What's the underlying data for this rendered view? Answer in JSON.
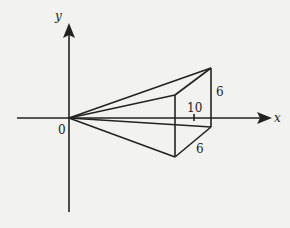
{
  "diagram": {
    "axes": {
      "x_label": "x",
      "y_label": "y",
      "origin_label": "0"
    },
    "labels": {
      "tick_value": "10",
      "height_edge": "6",
      "depth_edge": "6"
    },
    "colors": {
      "stroke": "#222222",
      "background": "#f2f2f0"
    }
  }
}
